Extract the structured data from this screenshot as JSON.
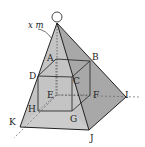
{
  "diagram": {
    "title": "",
    "height_label": "x m",
    "vertex_labels": {
      "A": "A",
      "B": "B",
      "C": "C",
      "D": "D",
      "E": "E",
      "F": "F",
      "G": "G",
      "H": "H",
      "I": "I",
      "J": "J",
      "K": "K"
    },
    "colors": {
      "face_left": "#c9c9c9",
      "face_right": "#a9a9a9",
      "face_front": "#bdbdbd",
      "edge": "#2a2a2a",
      "hidden_edge": "#555555",
      "ball": "#ffffff"
    }
  }
}
